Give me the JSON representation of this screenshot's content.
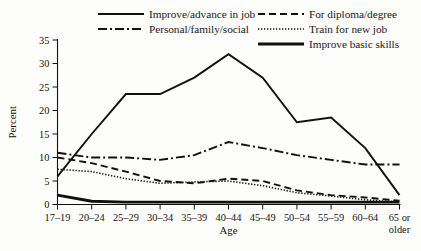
{
  "chart_data": {
    "type": "line",
    "title": "",
    "xlabel": "Age",
    "ylabel": "Percent",
    "categories": [
      "17–19",
      "20–24",
      "25–29",
      "30–34",
      "35–39",
      "40–44",
      "45–49",
      "50–54",
      "55–59",
      "60–64",
      "65 or older"
    ],
    "ylim": [
      0,
      35
    ],
    "yticks": [
      0,
      5,
      10,
      15,
      20,
      25,
      30,
      35
    ],
    "ytick_labels": [
      "0",
      "5",
      "10",
      "15",
      "20",
      "25",
      "30",
      "35"
    ],
    "grid": false,
    "legend_position": "top",
    "series": [
      {
        "name": "Improve/advance in job",
        "style": "solid",
        "values": [
          6.0,
          15.0,
          23.5,
          23.5,
          27.0,
          32.0,
          27.0,
          17.5,
          18.5,
          12.0,
          2.0
        ]
      },
      {
        "name": "For diploma/degree",
        "style": "dashed",
        "values": [
          10.0,
          8.8,
          7.0,
          5.0,
          4.5,
          5.5,
          5.0,
          3.0,
          2.0,
          1.5,
          0.8
        ]
      },
      {
        "name": "Personal/family/social",
        "style": "dash-dot",
        "values": [
          11.0,
          10.0,
          10.0,
          9.5,
          10.5,
          13.3,
          12.0,
          10.5,
          9.5,
          8.5,
          8.5
        ]
      },
      {
        "name": "Train for new job",
        "style": "dotted",
        "values": [
          7.5,
          7.0,
          5.5,
          4.5,
          4.8,
          5.0,
          4.0,
          2.5,
          1.8,
          1.0,
          0.5
        ]
      },
      {
        "name": "Improve basic skills",
        "style": "thick-solid",
        "values": [
          2.0,
          0.7,
          0.5,
          0.5,
          0.5,
          0.5,
          0.5,
          0.5,
          0.5,
          0.5,
          0.5
        ]
      }
    ]
  },
  "legend": {
    "columns": [
      {
        "entries": [
          {
            "label": "Improve/advance in job",
            "style": "solid"
          },
          {
            "label": "Personal/family/social",
            "style": "dash-dot"
          }
        ]
      },
      {
        "entries": [
          {
            "label": "For diploma/degree",
            "style": "dashed"
          },
          {
            "label": "Train for new job",
            "style": "dotted"
          },
          {
            "label": "Improve basic skills",
            "style": "thick-solid"
          }
        ]
      }
    ]
  },
  "axes": {
    "y_title": "Percent",
    "x_title": "Age"
  },
  "colors": {
    "ink": "#111111",
    "background": "#fdfdfb"
  }
}
